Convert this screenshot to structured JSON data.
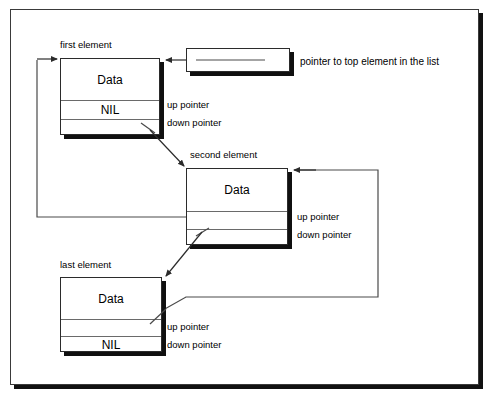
{
  "diagram": {
    "frame": {
      "visible": true
    },
    "top_pointer": {
      "label": "pointer to top element in the list",
      "box_name": "top-pointer-box"
    },
    "nodes": [
      {
        "id": "first",
        "caption": "first element",
        "data_label": "Data",
        "up_cell_label": "NIL",
        "down_cell_label": "",
        "pointer_labels": {
          "up": "up pointer",
          "down": "down pointer"
        }
      },
      {
        "id": "second",
        "caption": "second element",
        "data_label": "Data",
        "up_cell_label": "",
        "down_cell_label": "",
        "pointer_labels": {
          "up": "up pointer",
          "down": "down pointer"
        }
      },
      {
        "id": "last",
        "caption": "last element",
        "data_label": "Data",
        "up_cell_label": "",
        "down_cell_label": "NIL",
        "pointer_labels": {
          "up": "up pointer",
          "down": "down pointer"
        }
      }
    ],
    "colors": {
      "ink": "#000000",
      "line": "#4a4a4a",
      "box_border": "#2b2b2b",
      "shadow": "#101010",
      "paper": "#ffffff"
    }
  }
}
